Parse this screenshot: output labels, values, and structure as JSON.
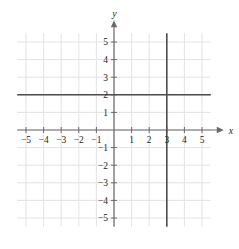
{
  "figure": {
    "kind": "cartesian-coordinate-plane",
    "background_color": "#ffffff",
    "grid_color": "#e3e3e6",
    "axis_color": "#6a6a6e",
    "plot_line_color": "#4d4d4f",
    "label_color": "#231f20"
  },
  "axes": {
    "x_axis_name": "x",
    "y_axis_name": "y",
    "x_min": -5.5,
    "x_max": 5.5,
    "y_min": -5.5,
    "y_max": 5.5,
    "x_tick_labels": [
      "−5",
      "−4",
      "−3",
      "−2",
      "−1",
      "1",
      "2",
      "3",
      "4",
      "5"
    ],
    "x_tick_values": [
      -5,
      -4,
      -3,
      -2,
      -1,
      1,
      2,
      3,
      4,
      5
    ],
    "y_tick_labels": [
      "5",
      "4",
      "3",
      "2",
      "1",
      "−1",
      "−2",
      "−3",
      "−4",
      "−5"
    ],
    "y_tick_values": [
      5,
      4,
      3,
      2,
      1,
      -1,
      -2,
      -3,
      -4,
      -5
    ],
    "x_arrow": "right-arrowhead",
    "y_arrow": "up-arrowhead"
  },
  "chart_data": {
    "type": "line",
    "title": "",
    "xlabel": "x",
    "ylabel": "y",
    "xlim": [
      -5.5,
      5.5
    ],
    "ylim": [
      -5.5,
      5.5
    ],
    "grid": true,
    "grid_step": 1,
    "legend": "none",
    "series": [
      {
        "name": "y = 2",
        "kind": "horizontal-line",
        "equation": "y = 2",
        "y": 2,
        "x_start": -5.5,
        "x_end": 5.5,
        "color": "#4d4d4f"
      },
      {
        "name": "x = 3",
        "kind": "vertical-line",
        "equation": "x = 3",
        "x": 3,
        "y_start": -5.5,
        "y_end": 5.5,
        "color": "#4d4d4f"
      }
    ],
    "intersection": {
      "x": 3,
      "y": 2
    }
  }
}
